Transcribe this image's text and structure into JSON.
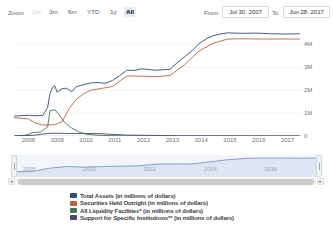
{
  "toolbar": {
    "zoom_label": "Zoom",
    "buttons": [
      {
        "label": "1m",
        "state": "dim"
      },
      {
        "label": "3m",
        "state": "normal"
      },
      {
        "label": "6m",
        "state": "normal"
      },
      {
        "label": "YTD",
        "state": "normal"
      },
      {
        "label": "1y",
        "state": "normal"
      },
      {
        "label": "All",
        "state": "selected"
      }
    ],
    "from_label": "From",
    "from_value": "Jul 30, 2007",
    "to_label": "To",
    "to_value": "Jun 28, 2017"
  },
  "navigator": {
    "tick_labels": [
      "2008",
      "2010",
      "2012",
      "2014",
      "2016"
    ],
    "scroll_left_arrow": "◂",
    "scroll_right_arrow": "▸"
  },
  "colors": {
    "total_assets": "#2f4b7c",
    "securities": "#c1603f",
    "liquidity": "#3f7a4e",
    "support": "#4b4670",
    "navigator_series": "#6b8cba",
    "grid": "#e6e6e6"
  },
  "chart_data": {
    "type": "line",
    "title": "",
    "xlabel": "",
    "ylabel": "",
    "xlim": [
      "2007-07-30",
      "2017-06-28"
    ],
    "ylim": [
      0,
      4800000
    ],
    "y_tick_labels": [
      "0",
      "1M",
      "2M",
      "3M",
      "4M"
    ],
    "y_tick_values": [
      0,
      1000000,
      2000000,
      3000000,
      4000000
    ],
    "x_tick_labels": [
      "2008",
      "2009",
      "2010",
      "2011",
      "2012",
      "2013",
      "2014",
      "2015",
      "2016",
      "2017"
    ],
    "grid": true,
    "legend_position": "bottom",
    "units": "millions of dollars",
    "series": [
      {
        "name": "Total Assets (in millions of dollars)",
        "color": "#2f4b7c",
        "x": [
          "2007-07",
          "2007-10",
          "2008-01",
          "2008-04",
          "2008-07",
          "2008-09",
          "2008-10",
          "2008-11",
          "2008-12",
          "2009-01",
          "2009-03",
          "2009-05",
          "2009-07",
          "2009-09",
          "2009-12",
          "2010-03",
          "2010-06",
          "2010-09",
          "2010-12",
          "2011-03",
          "2011-06",
          "2011-09",
          "2011-12",
          "2012-06",
          "2012-12",
          "2013-03",
          "2013-06",
          "2013-09",
          "2013-12",
          "2014-03",
          "2014-06",
          "2014-09",
          "2014-12",
          "2015-06",
          "2015-12",
          "2016-06",
          "2016-12",
          "2017-06"
        ],
        "values": [
          869000,
          889000,
          906000,
          885000,
          900000,
          1200000,
          1800000,
          2100000,
          2250000,
          1950000,
          2070000,
          2100000,
          2000000,
          2150000,
          2240000,
          2320000,
          2330000,
          2300000,
          2420000,
          2630000,
          2870000,
          2860000,
          2930000,
          2870000,
          2910000,
          3200000,
          3450000,
          3700000,
          4030000,
          4230000,
          4380000,
          4450000,
          4500000,
          4480000,
          4490000,
          4460000,
          4450000,
          4460000
        ]
      },
      {
        "name": "Securities Held Outright (in millions of dollars)",
        "color": "#c1603f",
        "x": [
          "2007-07",
          "2007-10",
          "2008-01",
          "2008-04",
          "2008-07",
          "2008-09",
          "2008-10",
          "2008-12",
          "2009-03",
          "2009-06",
          "2009-09",
          "2009-12",
          "2010-03",
          "2010-06",
          "2010-12",
          "2011-06",
          "2011-12",
          "2012-06",
          "2012-12",
          "2013-06",
          "2013-12",
          "2014-06",
          "2014-12",
          "2015-06",
          "2016-06",
          "2017-06"
        ],
        "values": [
          790000,
          780000,
          740000,
          560000,
          480000,
          480000,
          490000,
          500000,
          620000,
          1200000,
          1600000,
          1840000,
          2000000,
          2050000,
          2160000,
          2620000,
          2610000,
          2590000,
          2640000,
          3100000,
          3700000,
          4050000,
          4230000,
          4240000,
          4230000,
          4230000
        ]
      },
      {
        "name": "All Liquidity Facilities* (in millions of dollars)",
        "color": "#3f7a4e",
        "x": [
          "2007-07",
          "2007-12",
          "2008-03",
          "2008-06",
          "2008-09",
          "2008-10",
          "2008-12",
          "2009-02",
          "2009-04",
          "2009-07",
          "2009-10",
          "2010-01",
          "2010-06",
          "2011-06",
          "2012-06",
          "2013-06",
          "2015-06",
          "2017-06"
        ],
        "values": [
          0,
          40000,
          150000,
          170000,
          400000,
          1100000,
          1150000,
          900000,
          600000,
          350000,
          180000,
          80000,
          30000,
          5000,
          2000,
          1000,
          500,
          200
        ]
      },
      {
        "name": "Support for Specific Institutions** (in millions of dollars)",
        "color": "#4b4670",
        "x": [
          "2007-07",
          "2008-03",
          "2008-09",
          "2008-12",
          "2009-06",
          "2010-06",
          "2011-06",
          "2013-06",
          "2015-06",
          "2017-06"
        ],
        "values": [
          0,
          29000,
          110000,
          120000,
          110000,
          105000,
          40000,
          5000,
          2000,
          1000
        ]
      }
    ],
    "navigator_series": {
      "name": "Total Assets (in millions of dollars)",
      "color": "#6b8cba",
      "values": [
        869000,
        900000,
        1800000,
        2250000,
        2070000,
        2240000,
        2330000,
        2420000,
        2870000,
        2930000,
        2910000,
        3450000,
        4030000,
        4380000,
        4500000,
        4490000,
        4450000,
        4460000
      ]
    }
  }
}
